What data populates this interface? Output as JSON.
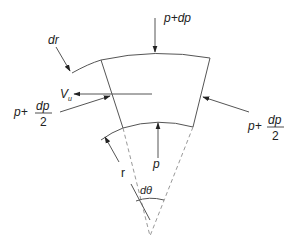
{
  "diagram": {
    "labels": {
      "top_pressure": "p+dp",
      "bottom_pressure": "p",
      "left_pressure_base": "p+",
      "left_pressure_num": "dp",
      "left_pressure_den": "2",
      "right_pressure_base": "p+",
      "right_pressure_num": "dp",
      "right_pressure_den": "2",
      "thickness": "dr",
      "velocity": "V",
      "velocity_sub": "u",
      "radius": "r",
      "angle": "dθ"
    },
    "colors": {
      "line": "#555555",
      "dashed": "#999999",
      "text": "#222222"
    }
  }
}
